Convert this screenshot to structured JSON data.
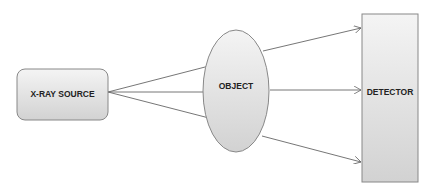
{
  "diagram": {
    "source": {
      "label": "X-RAY SOURCE"
    },
    "object": {
      "label": "OBJECT"
    },
    "detector": {
      "label": "DETECTOR"
    }
  },
  "colors": {
    "stroke": "#777777",
    "fill_top": "#f2f2f2",
    "fill_bottom": "#d0d0d0",
    "line": "#666666"
  }
}
